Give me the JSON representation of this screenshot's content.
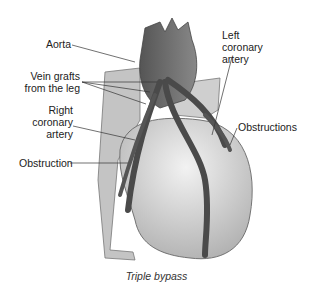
{
  "figure": {
    "caption": "Triple bypass",
    "labels": {
      "aorta": "Aorta",
      "vein_grafts_1": "Vein grafts",
      "vein_grafts_2": "from the leg",
      "right_coronary_1": "Right",
      "right_coronary_2": "coronary",
      "right_coronary_3": "artery",
      "obstruction": "Obstruction",
      "left_coronary_1": "Left",
      "left_coronary_2": "coronary",
      "left_coronary_3": "artery",
      "obstructions": "Obstructions"
    },
    "colors": {
      "heart": "#d4d4d4",
      "vessel": "#555555",
      "aorta": "#6a6a6a",
      "label": "#222222"
    }
  }
}
